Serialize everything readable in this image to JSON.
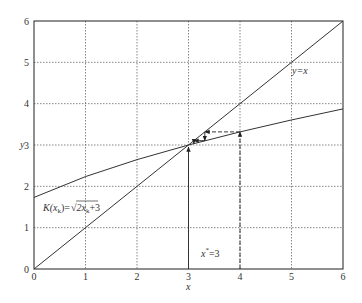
{
  "chart_data": {
    "type": "line",
    "title": "",
    "xlabel": "x",
    "ylabel": "y",
    "xlim": [
      0,
      6
    ],
    "ylim": [
      0,
      6
    ],
    "xticks": [
      0,
      1,
      2,
      3,
      4,
      5,
      6
    ],
    "yticks": [
      0,
      1,
      2,
      3,
      4,
      5,
      6
    ],
    "xtick_labels": [
      "0",
      "1",
      "2",
      "3",
      "4",
      "5",
      "6"
    ],
    "ytick_labels": [
      "0",
      "1",
      "2",
      "3",
      "4",
      "5",
      "6"
    ],
    "grid": true,
    "grid_style": "dotted",
    "series": [
      {
        "name": "y=x",
        "label": "y=x",
        "function": "y = x",
        "x": [
          0,
          1,
          2,
          3,
          4,
          5,
          6
        ],
        "y": [
          0,
          1,
          2,
          3,
          4,
          5,
          6
        ]
      },
      {
        "name": "K(x_k)=sqrt(2x_k+3)",
        "label": "K(x_k)=√(2x_k+3)",
        "function": "y = sqrt(2x + 3)",
        "x": [
          0,
          1,
          2,
          3,
          4,
          5,
          6
        ],
        "y": [
          1.732,
          2.236,
          2.646,
          3.0,
          3.317,
          3.606,
          3.873
        ]
      }
    ],
    "cobweb": {
      "start_x": 4,
      "fixed_point": 3,
      "path": [
        [
          4,
          0
        ],
        [
          4,
          3.317
        ],
        [
          3.317,
          3.317
        ],
        [
          3.317,
          3.104
        ],
        [
          3.104,
          3.104
        ],
        [
          3.104,
          3.035
        ]
      ]
    },
    "annotations": [
      {
        "text": "y=x",
        "x": 5.05,
        "y": 4.7
      },
      {
        "text": "K(x_k)=√(2x_k+3)",
        "x": 0.2,
        "y": 1.55
      },
      {
        "text": "x*=3",
        "x": 3.35,
        "y": 0.5
      }
    ],
    "fixed_point_arrow": {
      "from": [
        3,
        0
      ],
      "to": [
        3,
        3
      ]
    }
  },
  "labels": {
    "xlabel": "x",
    "ylabel": "y",
    "line_label": "y=x",
    "curve_label_prefix": "K(x",
    "curve_label_sub": "k",
    "curve_label_mid": ")=",
    "curve_label_radicand": "2x",
    "curve_label_radicand_sub": "k",
    "curve_label_tail": "+3",
    "fixed_point_label_x": "x",
    "fixed_point_label_sup": "*",
    "fixed_point_label_tail": "=3"
  },
  "colors": {
    "axis": "#333333",
    "grid": "#555555",
    "line": "#333333",
    "background": "#ffffff"
  }
}
